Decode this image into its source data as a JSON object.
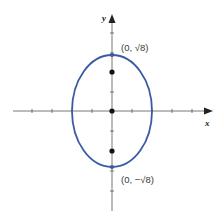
{
  "figure": {
    "x_axis_label": "x",
    "y_axis_label": "y",
    "vertex_top_label": "(0, √8)",
    "vertex_bottom_label": "(0, −√8)"
  },
  "colors": {
    "ellipse": "#3a5aa6",
    "axes": "#444444",
    "points": "#111111"
  },
  "geometry": {
    "shape": "ellipse",
    "center": [
      0,
      0
    ],
    "semi_axis_x": 2,
    "semi_axis_y": "√8",
    "foci": [
      [
        0,
        2
      ],
      [
        0,
        -2
      ]
    ],
    "vertices": [
      [
        0,
        "√8"
      ],
      [
        0,
        "-√8"
      ]
    ],
    "tick_spacing": 1
  }
}
